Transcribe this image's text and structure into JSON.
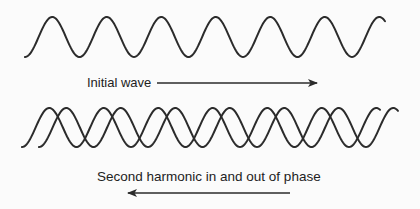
{
  "diagram": {
    "colors": {
      "background": "#fbfbfb",
      "stroke": "#2b2b2b",
      "text": "#222222"
    },
    "top_wave": {
      "label": "Initial wave",
      "start_x": 25,
      "end_x": 385,
      "center_y": 37,
      "amplitude": 20,
      "period": 54.5,
      "start_phase": "trough",
      "arrow": {
        "direction": "right",
        "x1": 157,
        "x2": 317,
        "y": 83
      }
    },
    "bottom_waves": {
      "label": "Second harmonic in and out of phase",
      "waves": [
        {
          "name": "wave-a",
          "start_x": 22,
          "end_x": 380,
          "center_y": 127.5,
          "amplitude": 19.5,
          "period": 54.5,
          "start_phase": "trough"
        },
        {
          "name": "wave-b",
          "start_x": 39,
          "end_x": 398,
          "center_y": 127.5,
          "amplitude": 19.5,
          "period": 54.5,
          "start_phase": "trough"
        }
      ],
      "arrow": {
        "direction": "left",
        "x1": 290,
        "x2": 128,
        "y": 193
      }
    }
  }
}
